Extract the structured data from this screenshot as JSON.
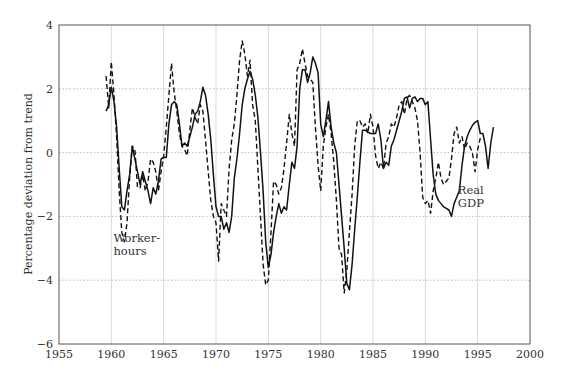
{
  "chart_data": {
    "type": "line",
    "title": "",
    "xlabel": "",
    "ylabel": "Percentage deviation from trend",
    "xlim": [
      1955,
      2000
    ],
    "ylim": [
      -6,
      4
    ],
    "x_ticks": [
      1955,
      1960,
      1965,
      1970,
      1975,
      1980,
      1985,
      1990,
      1995,
      2000
    ],
    "x_tick_labels": [
      "1955",
      "1960",
      "1965",
      "1970",
      "1975",
      "1980",
      "1985",
      "1990",
      "1995",
      "2000"
    ],
    "y_ticks": [
      -6,
      -4,
      -2,
      0,
      2,
      4
    ],
    "y_tick_labels": [
      "−6",
      "−4",
      "−2",
      "0",
      "2",
      "4"
    ],
    "grid": {
      "vertical": "solid-light",
      "horizontal": "dotted"
    },
    "legend": "none (inline annotations)",
    "annotations": [
      {
        "text_lines": [
          "Worker-",
          "hours"
        ],
        "x": 1960.2,
        "y": -2.8,
        "refers_to": "Worker-hours"
      },
      {
        "text_lines": [
          "Real",
          "GDP"
        ],
        "x": 1993.1,
        "y": -1.3,
        "refers_to": "Real GDP"
      }
    ],
    "series": [
      {
        "name": "Real GDP",
        "style": "solid",
        "color": "#111111",
        "points": [
          [
            1959.5,
            1.3
          ],
          [
            1959.75,
            1.5
          ],
          [
            1960.0,
            2.05
          ],
          [
            1960.25,
            1.6
          ],
          [
            1960.5,
            0.8
          ],
          [
            1960.75,
            -0.5
          ],
          [
            1961.0,
            -1.7
          ],
          [
            1961.25,
            -1.8
          ],
          [
            1961.5,
            -1.2
          ],
          [
            1961.75,
            -0.7
          ],
          [
            1962.0,
            0.2
          ],
          [
            1962.25,
            -0.2
          ],
          [
            1962.5,
            -0.6
          ],
          [
            1962.75,
            -1.0
          ],
          [
            1963.0,
            -0.6
          ],
          [
            1963.25,
            -0.9
          ],
          [
            1963.5,
            -1.2
          ],
          [
            1963.75,
            -1.6
          ],
          [
            1964.0,
            -1.1
          ],
          [
            1964.25,
            -1.3
          ],
          [
            1964.5,
            -0.9
          ],
          [
            1964.75,
            -0.2
          ],
          [
            1965.0,
            -0.15
          ],
          [
            1965.25,
            -0.15
          ],
          [
            1965.5,
            0.9
          ],
          [
            1965.75,
            1.5
          ],
          [
            1966.0,
            1.6
          ],
          [
            1966.25,
            1.5
          ],
          [
            1966.5,
            0.9
          ],
          [
            1966.75,
            0.2
          ],
          [
            1967.0,
            0.3
          ],
          [
            1967.25,
            0.2
          ],
          [
            1967.5,
            0.5
          ],
          [
            1967.75,
            0.8
          ],
          [
            1968.0,
            1.2
          ],
          [
            1968.25,
            1.3
          ],
          [
            1968.5,
            1.6
          ],
          [
            1968.75,
            2.05
          ],
          [
            1969.0,
            1.8
          ],
          [
            1969.25,
            1.2
          ],
          [
            1969.5,
            0.4
          ],
          [
            1969.75,
            -0.7
          ],
          [
            1970.0,
            -1.7
          ],
          [
            1970.25,
            -2.0
          ],
          [
            1970.5,
            -2.0
          ],
          [
            1970.75,
            -2.4
          ],
          [
            1971.0,
            -2.2
          ],
          [
            1971.25,
            -2.5
          ],
          [
            1971.5,
            -2.0
          ],
          [
            1971.75,
            -0.8
          ],
          [
            1972.0,
            -0.2
          ],
          [
            1972.25,
            0.6
          ],
          [
            1972.5,
            1.5
          ],
          [
            1972.75,
            2.0
          ],
          [
            1973.0,
            2.3
          ],
          [
            1973.25,
            2.55
          ],
          [
            1973.5,
            2.3
          ],
          [
            1973.75,
            1.8
          ],
          [
            1974.0,
            1.1
          ],
          [
            1974.25,
            0.0
          ],
          [
            1974.5,
            -1.2
          ],
          [
            1974.75,
            -2.8
          ],
          [
            1975.0,
            -3.6
          ],
          [
            1975.25,
            -3.2
          ],
          [
            1975.5,
            -2.5
          ],
          [
            1975.75,
            -2.0
          ],
          [
            1976.0,
            -1.6
          ],
          [
            1976.25,
            -1.9
          ],
          [
            1976.5,
            -1.7
          ],
          [
            1976.75,
            -1.8
          ],
          [
            1977.0,
            -1.0
          ],
          [
            1977.25,
            -0.3
          ],
          [
            1977.5,
            -0.5
          ],
          [
            1977.75,
            0.2
          ],
          [
            1978.0,
            2.0
          ],
          [
            1978.25,
            2.6
          ],
          [
            1978.5,
            2.6
          ],
          [
            1978.75,
            2.2
          ],
          [
            1979.0,
            2.5
          ],
          [
            1979.25,
            3.0
          ],
          [
            1979.5,
            2.8
          ],
          [
            1979.75,
            2.5
          ],
          [
            1980.0,
            0.9
          ],
          [
            1980.25,
            0.5
          ],
          [
            1980.5,
            1.0
          ],
          [
            1980.75,
            1.6
          ],
          [
            1981.0,
            0.8
          ],
          [
            1981.25,
            0.3
          ],
          [
            1981.5,
            0.0
          ],
          [
            1981.75,
            -1.0
          ],
          [
            1982.0,
            -2.0
          ],
          [
            1982.25,
            -3.0
          ],
          [
            1982.5,
            -4.1
          ],
          [
            1982.75,
            -4.3
          ],
          [
            1983.0,
            -3.5
          ],
          [
            1983.25,
            -2.4
          ],
          [
            1983.5,
            -1.4
          ],
          [
            1983.75,
            -0.3
          ],
          [
            1984.0,
            0.7
          ],
          [
            1984.25,
            0.7
          ],
          [
            1984.5,
            0.65
          ],
          [
            1984.75,
            0.6
          ],
          [
            1985.0,
            0.6
          ],
          [
            1985.25,
            0.6
          ],
          [
            1985.5,
            0.9
          ],
          [
            1985.75,
            0.4
          ],
          [
            1986.0,
            -0.5
          ],
          [
            1986.25,
            -0.3
          ],
          [
            1986.5,
            -0.4
          ],
          [
            1986.75,
            0.2
          ],
          [
            1987.0,
            0.4
          ],
          [
            1987.25,
            0.7
          ],
          [
            1987.5,
            1.0
          ],
          [
            1987.75,
            1.3
          ],
          [
            1988.0,
            1.7
          ],
          [
            1988.25,
            1.75
          ],
          [
            1988.5,
            1.4
          ],
          [
            1988.75,
            1.7
          ],
          [
            1989.0,
            1.75
          ],
          [
            1989.25,
            1.6
          ],
          [
            1989.5,
            1.7
          ],
          [
            1989.75,
            1.7
          ],
          [
            1990.0,
            1.5
          ],
          [
            1990.25,
            1.6
          ],
          [
            1990.5,
            0.4
          ],
          [
            1990.75,
            -0.7
          ],
          [
            1991.0,
            -1.3
          ],
          [
            1991.25,
            -1.5
          ],
          [
            1991.5,
            -1.6
          ],
          [
            1991.75,
            -1.7
          ],
          [
            1992.0,
            -1.75
          ],
          [
            1992.25,
            -1.8
          ],
          [
            1992.5,
            -2.0
          ],
          [
            1992.75,
            -1.6
          ],
          [
            1993.0,
            -1.4
          ],
          [
            1993.25,
            -1.2
          ],
          [
            1993.5,
            -0.4
          ],
          [
            1993.75,
            0.2
          ],
          [
            1994.0,
            0.5
          ],
          [
            1994.25,
            0.7
          ],
          [
            1994.5,
            0.85
          ],
          [
            1994.75,
            0.95
          ],
          [
            1995.0,
            1.0
          ],
          [
            1995.25,
            0.6
          ],
          [
            1995.5,
            0.6
          ],
          [
            1995.75,
            0.2
          ],
          [
            1996.0,
            -0.5
          ],
          [
            1996.25,
            0.3
          ],
          [
            1996.5,
            0.8
          ]
        ]
      },
      {
        "name": "Worker-hours",
        "style": "dashed",
        "color": "#111111",
        "points": [
          [
            1959.5,
            2.4
          ],
          [
            1959.75,
            1.4
          ],
          [
            1960.0,
            2.85
          ],
          [
            1960.25,
            1.8
          ],
          [
            1960.5,
            0.5
          ],
          [
            1960.75,
            -1.2
          ],
          [
            1961.0,
            -2.5
          ],
          [
            1961.25,
            -2.8
          ],
          [
            1961.5,
            -2.2
          ],
          [
            1961.75,
            -0.8
          ],
          [
            1962.0,
            0.2
          ],
          [
            1962.25,
            0.1
          ],
          [
            1962.5,
            -1.1
          ],
          [
            1962.75,
            -1.1
          ],
          [
            1963.0,
            -0.7
          ],
          [
            1963.25,
            -1.2
          ],
          [
            1963.5,
            -0.9
          ],
          [
            1963.75,
            -0.2
          ],
          [
            1964.0,
            -0.3
          ],
          [
            1964.25,
            -0.6
          ],
          [
            1964.5,
            -1.2
          ],
          [
            1964.75,
            -0.6
          ],
          [
            1965.0,
            -0.1
          ],
          [
            1965.25,
            0.8
          ],
          [
            1965.5,
            1.8
          ],
          [
            1965.75,
            2.8
          ],
          [
            1966.0,
            1.9
          ],
          [
            1966.25,
            1.3
          ],
          [
            1966.5,
            0.6
          ],
          [
            1966.75,
            0.2
          ],
          [
            1967.0,
            0.1
          ],
          [
            1967.25,
            -0.1
          ],
          [
            1967.5,
            0.7
          ],
          [
            1967.75,
            1.4
          ],
          [
            1968.0,
            1.1
          ],
          [
            1968.25,
            0.9
          ],
          [
            1968.5,
            1.5
          ],
          [
            1968.75,
            1.3
          ],
          [
            1969.0,
            0.4
          ],
          [
            1969.25,
            -0.6
          ],
          [
            1969.5,
            -1.5
          ],
          [
            1969.75,
            -2.0
          ],
          [
            1970.0,
            -2.2
          ],
          [
            1970.25,
            -3.4
          ],
          [
            1970.5,
            -1.6
          ],
          [
            1970.75,
            -1.8
          ],
          [
            1971.0,
            -2.0
          ],
          [
            1971.25,
            -0.5
          ],
          [
            1971.5,
            0.4
          ],
          [
            1971.75,
            0.9
          ],
          [
            1972.0,
            1.8
          ],
          [
            1972.25,
            2.9
          ],
          [
            1972.5,
            3.5
          ],
          [
            1972.75,
            3.1
          ],
          [
            1973.0,
            2.4
          ],
          [
            1973.25,
            2.9
          ],
          [
            1973.5,
            1.5
          ],
          [
            1973.75,
            1.0
          ],
          [
            1974.0,
            -0.5
          ],
          [
            1974.25,
            -2.0
          ],
          [
            1974.5,
            -3.5
          ],
          [
            1974.75,
            -4.15
          ],
          [
            1975.0,
            -4.0
          ],
          [
            1975.25,
            -2.5
          ],
          [
            1975.5,
            -0.9
          ],
          [
            1975.75,
            -1.0
          ],
          [
            1976.0,
            -1.3
          ],
          [
            1976.25,
            -1.1
          ],
          [
            1976.5,
            -0.5
          ],
          [
            1976.75,
            0.3
          ],
          [
            1977.0,
            1.2
          ],
          [
            1977.25,
            0.6
          ],
          [
            1977.5,
            0.2
          ],
          [
            1977.75,
            2.6
          ],
          [
            1978.0,
            2.8
          ],
          [
            1978.25,
            3.25
          ],
          [
            1978.5,
            2.8
          ],
          [
            1978.75,
            2.4
          ],
          [
            1979.0,
            2.3
          ],
          [
            1979.25,
            2.2
          ],
          [
            1979.5,
            0.8
          ],
          [
            1979.75,
            -0.4
          ],
          [
            1980.0,
            -1.2
          ],
          [
            1980.25,
            0.2
          ],
          [
            1980.5,
            0.8
          ],
          [
            1980.75,
            1.2
          ],
          [
            1981.0,
            0.6
          ],
          [
            1981.25,
            -0.3
          ],
          [
            1981.5,
            -1.5
          ],
          [
            1981.75,
            -3.0
          ],
          [
            1982.0,
            -3.2
          ],
          [
            1982.25,
            -4.4
          ],
          [
            1982.5,
            -3.7
          ],
          [
            1982.75,
            -2.5
          ],
          [
            1983.0,
            -1.3
          ],
          [
            1983.25,
            0.2
          ],
          [
            1983.5,
            1.0
          ],
          [
            1983.75,
            1.0
          ],
          [
            1984.0,
            0.8
          ],
          [
            1984.25,
            0.9
          ],
          [
            1984.5,
            0.6
          ],
          [
            1984.75,
            1.2
          ],
          [
            1985.0,
            0.8
          ],
          [
            1985.25,
            -0.1
          ],
          [
            1985.5,
            -0.5
          ],
          [
            1985.75,
            -0.3
          ],
          [
            1986.0,
            -0.5
          ],
          [
            1986.25,
            0.3
          ],
          [
            1986.5,
            0.5
          ],
          [
            1986.75,
            0.9
          ],
          [
            1987.0,
            0.8
          ],
          [
            1987.25,
            1.1
          ],
          [
            1987.5,
            1.5
          ],
          [
            1987.75,
            1.6
          ],
          [
            1988.0,
            1.2
          ],
          [
            1988.25,
            1.7
          ],
          [
            1988.5,
            1.8
          ],
          [
            1988.75,
            1.6
          ],
          [
            1989.0,
            1.4
          ],
          [
            1989.25,
            1.0
          ],
          [
            1989.5,
            0.0
          ],
          [
            1989.75,
            -1.4
          ],
          [
            1990.0,
            -1.6
          ],
          [
            1990.25,
            -1.5
          ],
          [
            1990.5,
            -1.9
          ],
          [
            1990.75,
            -1.2
          ],
          [
            1991.0,
            -0.8
          ],
          [
            1991.25,
            -0.3
          ],
          [
            1991.5,
            -0.8
          ],
          [
            1991.75,
            -1.0
          ],
          [
            1992.0,
            -0.9
          ],
          [
            1992.25,
            -0.8
          ],
          [
            1992.5,
            -0.2
          ],
          [
            1992.75,
            0.6
          ],
          [
            1993.0,
            0.8
          ],
          [
            1993.25,
            0.3
          ],
          [
            1993.5,
            0.5
          ],
          [
            1993.75,
            0.1
          ],
          [
            1994.0,
            0.3
          ],
          [
            1994.25,
            0.2
          ],
          [
            1994.5,
            0.0
          ],
          [
            1994.75,
            -0.6
          ],
          [
            1995.0,
            0.1
          ],
          [
            1995.25,
            0.45
          ]
        ]
      }
    ]
  }
}
